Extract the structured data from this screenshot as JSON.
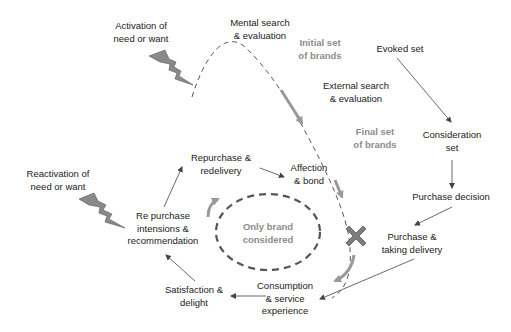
{
  "diagram": {
    "type": "consumer decision journey",
    "colors": {
      "text": "#222222",
      "grey_label": "#8c8c8c",
      "bolt_fill": "#8a8a8a",
      "arrow_grey": "#999999",
      "x_mark": "#7d7d7d",
      "line": "#444444"
    },
    "labels": {
      "activation": [
        "Activation of",
        "need or want"
      ],
      "mental_search": [
        "Mental search",
        "& evaluation"
      ],
      "initial_set": [
        "Initial set",
        "of brands"
      ],
      "evoked_set": [
        "Evoked set"
      ],
      "external_search": [
        "External search",
        "& evaluation"
      ],
      "final_set": [
        "Final set",
        "of brands"
      ],
      "consideration_set": [
        "Consideration",
        "set"
      ],
      "purchase_decision": [
        "Purchase decision"
      ],
      "purchase_delivery": [
        "Purchase &",
        "taking delivery"
      ],
      "consumption": [
        "Consumption",
        "& service",
        "experience"
      ],
      "satisfaction": [
        "Satisfaction &",
        "delight"
      ],
      "repurchase_intentions": [
        "Re purchase",
        "intensions &",
        "recommendation"
      ],
      "repurchase_redelivery": [
        "Repurchase &",
        "redelivery"
      ],
      "affection": [
        "Affection",
        "& bond"
      ],
      "only_brand": [
        "Only brand",
        "considered"
      ],
      "reactivation": [
        "Reactivation of",
        "need or want"
      ]
    },
    "icons": [
      "lightning-bolt-icon",
      "lightning-bolt-icon",
      "x-mark-icon"
    ]
  }
}
